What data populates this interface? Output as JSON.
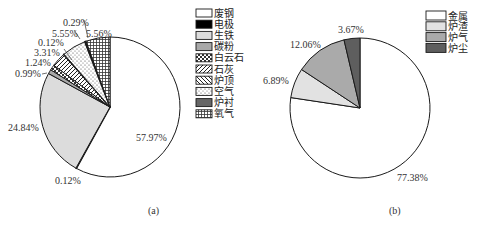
{
  "chart_data": [
    {
      "type": "pie",
      "caption": "(a)",
      "start_angle_deg": 0,
      "direction": "clockwise",
      "slices": [
        {
          "name": "废钢",
          "value": 57.97,
          "label": "57.97%",
          "fill": "#ffffff",
          "pattern": "none"
        },
        {
          "name": "电极",
          "value": 0.12,
          "label": "0.12%",
          "fill": "#000000",
          "pattern": "none"
        },
        {
          "name": "生铁",
          "value": 24.84,
          "label": "24.84%",
          "fill": "#dcdcdc",
          "pattern": "none"
        },
        {
          "name": "碳粉",
          "value": 0.99,
          "label": "0.99%",
          "fill": "#a8a8a8",
          "pattern": "none"
        },
        {
          "name": "白云石",
          "value": 1.24,
          "label": "1.24%",
          "fill": "#ffffff",
          "pattern": "checker"
        },
        {
          "name": "石灰",
          "value": 3.31,
          "label": "3.31%",
          "fill": "#ffffff",
          "pattern": "diag"
        },
        {
          "name": "炉顶",
          "value": 0.12,
          "label": "0.12%",
          "fill": "#ffffff",
          "pattern": "backdiag"
        },
        {
          "name": "空气",
          "value": 5.55,
          "label": "5.55%",
          "fill": "#ffffff",
          "pattern": "dots"
        },
        {
          "name": "炉衬",
          "value": 0.29,
          "label": "0.29%",
          "fill": "#666666",
          "pattern": "none"
        },
        {
          "name": "氧气",
          "value": 5.56,
          "label": "5.56%",
          "fill": "#ffffff",
          "pattern": "grid"
        }
      ],
      "legend": [
        "废钢",
        "电极",
        "生铁",
        "碳粉",
        "白云石",
        "石灰",
        "炉顶",
        "空气",
        "炉衬",
        "氧气"
      ],
      "legend_position": "right"
    },
    {
      "type": "pie",
      "caption": "(b)",
      "start_angle_deg": 0,
      "direction": "clockwise",
      "slices": [
        {
          "name": "金属",
          "value": 77.38,
          "label": "77.38%",
          "fill": "#ffffff"
        },
        {
          "name": "炉渣",
          "value": 6.89,
          "label": "6.89%",
          "fill": "#e2e2e2"
        },
        {
          "name": "炉气",
          "value": 12.06,
          "label": "12.06%",
          "fill": "#aaaaaa"
        },
        {
          "name": "炉尘",
          "value": 3.67,
          "label": "3.67%",
          "fill": "#5e5e5e"
        }
      ],
      "legend": [
        "金属",
        "炉渣",
        "炉气",
        "炉尘"
      ],
      "legend_position": "right"
    }
  ],
  "labels_a": {
    "p_feigang": "57.97%",
    "p_dianji": "0.12%",
    "p_shengtie": "24.84%",
    "p_tanfen": "0.99%",
    "p_baiyunshi": "1.24%",
    "p_shihui": "3.31%",
    "p_luding": "0.12%",
    "p_kongqi": "5.55%",
    "p_luchen": "0.29%",
    "p_yangqi": "5.56%",
    "caption": "(a)"
  },
  "labels_b": {
    "p_jinshu": "77.38%",
    "p_luzha": "6.89%",
    "p_luqi": "12.06%",
    "p_luchen": "3.67%",
    "caption": "(b)"
  },
  "legend_a": [
    "废钢",
    "电极",
    "生铁",
    "碳粉",
    "白云石",
    "石灰",
    "炉顶",
    "空气",
    "炉衬",
    "氧气"
  ],
  "legend_b": [
    "金属",
    "炉渣",
    "炉气",
    "炉尘"
  ]
}
